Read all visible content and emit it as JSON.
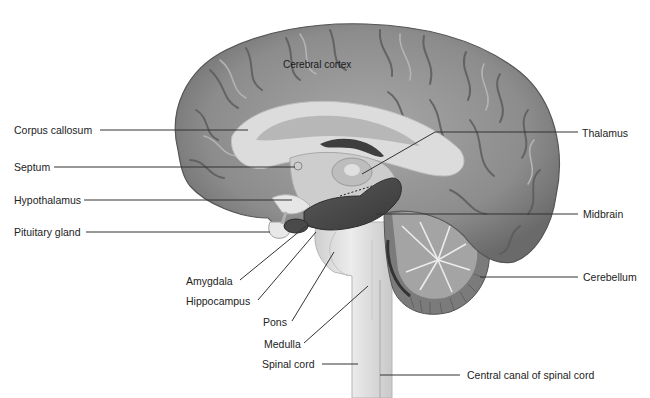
{
  "diagram": {
    "type": "anatomical-labeled-illustration",
    "colors": {
      "cortex": "#8f8f8f",
      "cortex_dark": "#5e5e5e",
      "white_matter": "#d9d9d9",
      "limbic_dark": "#4a4a4a",
      "brainstem": "#e2e2e2",
      "cerebellum": "#7a7a7a",
      "leader_line": "#333333",
      "text": "#222222"
    },
    "labels": {
      "cerebral_cortex": "Cerebral cortex",
      "corpus_callosum": "Corpus callosum",
      "septum": "Septum",
      "hypothalamus": "Hypothalamus",
      "pituitary_gland": "Pituitary gland",
      "amygdala": "Amygdala",
      "hippocampus": "Hippocampus",
      "pons": "Pons",
      "medulla": "Medulla",
      "spinal_cord": "Spinal cord",
      "central_canal": "Central canal of spinal cord",
      "thalamus": "Thalamus",
      "midbrain": "Midbrain",
      "cerebellum": "Cerebellum"
    }
  }
}
